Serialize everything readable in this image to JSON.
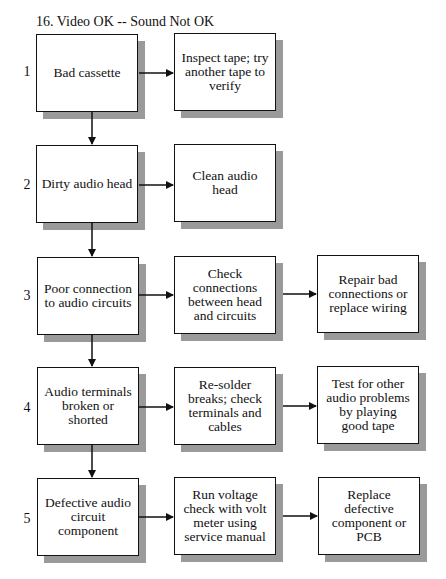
{
  "title": "16. Video OK -- Sound Not OK",
  "rows": [
    {
      "number": "1",
      "problem": "Bad cassette",
      "actions": [
        "Inspect tape; try another tape to verify"
      ]
    },
    {
      "number": "2",
      "problem": "Dirty audio head",
      "actions": [
        "Clean audio head"
      ]
    },
    {
      "number": "3",
      "problem": "Poor connection to audio circuits",
      "actions": [
        "Check connections between head and circuits",
        "Repair bad connections or replace wiring"
      ]
    },
    {
      "number": "4",
      "problem": "Audio terminals broken or shorted",
      "actions": [
        "Re-solder breaks; check terminals and cables",
        "Test for other audio problems by playing good tape"
      ]
    },
    {
      "number": "5",
      "problem": "Defective audio circuit component",
      "actions": [
        "Run voltage check with volt meter using service manual",
        "Replace defective component or PCB"
      ]
    }
  ],
  "colors": {
    "border": "#111111",
    "shadow": "#9a9a9a",
    "background": "#ffffff"
  }
}
